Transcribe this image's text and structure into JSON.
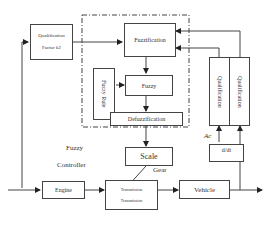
{
  "diagram": {
    "blocks": {
      "qualification_factor": {
        "line1": "Qualification",
        "line2": "Factor k2"
      },
      "fuzzification": "Fuzzification",
      "fuzzy": "Fuzzy",
      "fuzzy_rule": "Fuzzy Rule",
      "defuzzification": "Defuzzification",
      "scale": "Scale",
      "qualification_left": "Qualification",
      "qualification_right": "Qualification",
      "ddt": "d/dt",
      "engine": "Engine",
      "transmission": {
        "line1": "Transmission",
        "line2": "Transmission"
      },
      "vehicle": "Vehicle"
    },
    "labels": {
      "fuzzy_controller_line1": "Fuzzy",
      "fuzzy_controller_line2": "Controller",
      "gear": "Gear",
      "ac": "Ac"
    }
  }
}
